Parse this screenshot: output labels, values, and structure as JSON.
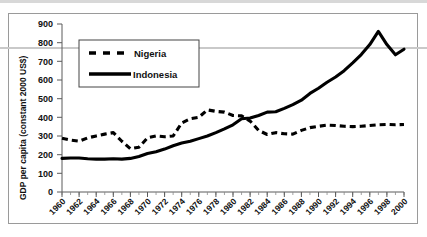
{
  "chart_data": {
    "type": "line",
    "title": "",
    "xlabel": "",
    "ylabel": "GDP per capita (constant 2000 US$)",
    "ylim": [
      0,
      900
    ],
    "xlim": [
      1960,
      2000
    ],
    "grid": false,
    "legend_position": "upper-left-inside",
    "ytick_labels": [
      "0",
      "100",
      "200",
      "300",
      "400",
      "500",
      "600",
      "700",
      "800",
      "900"
    ],
    "ytick_values": [
      0,
      100,
      200,
      300,
      400,
      500,
      600,
      700,
      800,
      900
    ],
    "xtick_labels": [
      "1960",
      "1962",
      "1964",
      "1966",
      "1968",
      "1970",
      "1972",
      "1974",
      "1976",
      "1978",
      "1980",
      "1982",
      "1984",
      "1986",
      "1988",
      "1990",
      "1992",
      "1994",
      "1996",
      "1998",
      "2000"
    ],
    "xtick_values": [
      1960,
      1962,
      1964,
      1966,
      1968,
      1970,
      1972,
      1974,
      1976,
      1978,
      1980,
      1982,
      1984,
      1986,
      1988,
      1990,
      1992,
      1994,
      1996,
      1998,
      2000
    ],
    "x": [
      1960,
      1961,
      1962,
      1963,
      1964,
      1965,
      1966,
      1967,
      1968,
      1969,
      1970,
      1971,
      1972,
      1973,
      1974,
      1975,
      1976,
      1977,
      1978,
      1979,
      1980,
      1981,
      1982,
      1983,
      1984,
      1985,
      1986,
      1987,
      1988,
      1989,
      1990,
      1991,
      1992,
      1993,
      1994,
      1995,
      1996,
      1997,
      1998,
      1999,
      2000
    ],
    "series": [
      {
        "name": "Nigeria",
        "style": "dashed",
        "color": "#000000",
        "values": [
          288,
          278,
          272,
          290,
          300,
          310,
          318,
          272,
          232,
          240,
          290,
          300,
          296,
          300,
          370,
          392,
          400,
          440,
          432,
          428,
          410,
          408,
          380,
          330,
          308,
          318,
          312,
          310,
          330,
          345,
          352,
          358,
          356,
          352,
          350,
          352,
          356,
          360,
          362,
          360,
          362
        ]
      },
      {
        "name": "Indonesia",
        "style": "solid",
        "color": "#000000",
        "values": [
          180,
          182,
          182,
          178,
          176,
          176,
          178,
          176,
          180,
          190,
          206,
          216,
          230,
          248,
          262,
          272,
          286,
          300,
          318,
          338,
          360,
          392,
          396,
          410,
          428,
          430,
          448,
          468,
          492,
          528,
          556,
          588,
          616,
          650,
          692,
          736,
          790,
          860,
          790,
          735,
          765
        ]
      }
    ]
  },
  "legend": {
    "entries": [
      {
        "label": "Nigeria",
        "style": "dashed"
      },
      {
        "label": "Indonesia",
        "style": "solid"
      }
    ]
  },
  "axes": {
    "y_title": "GDP per capita (constant 2000 US$)"
  }
}
